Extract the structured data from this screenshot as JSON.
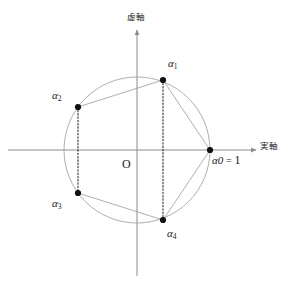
{
  "figure": {
    "width": 289,
    "height": 287,
    "background": "#ffffff",
    "axes": {
      "origin": {
        "x": 137,
        "y": 150
      },
      "origin_label": "O",
      "real_axis": {
        "label": "実軸",
        "label_x": 260,
        "label_y": 142,
        "x_start": 8,
        "x_end": 256,
        "y": 150,
        "arrow": "right",
        "color": "#8c8c8c"
      },
      "imaginary_axis": {
        "label": "虚軸",
        "label_x": 127,
        "label_y": 13,
        "x": 137,
        "y_start": 30,
        "y_end": 276,
        "arrow": "up",
        "color": "#8c8c8c"
      }
    },
    "circle": {
      "center_x": 137,
      "center_y": 150,
      "radius": 73,
      "stroke": "#9a9a9a",
      "stroke_width": 0.8,
      "fill": "none"
    },
    "styles": {
      "point_color": "#111111",
      "point_radius": 3.1,
      "chord_color": "#9a9a9a",
      "chord_width": 0.8,
      "dotted_color": "#2b2b2b",
      "dotted_width": 1.1,
      "dotted_dash": "1.4 1.9"
    }
  },
  "chart_data": {
    "type": "scatter",
    "xlabel": "実軸",
    "ylabel": "虚軸",
    "xlim": [
      -1.9,
      1.65
    ],
    "ylim": [
      -1.72,
      1.67
    ],
    "grid": false,
    "legend": null,
    "unit_circle": {
      "center": [
        0,
        0
      ],
      "radius": 1
    },
    "points": [
      {
        "id": "a0",
        "label": "α",
        "sub": "0",
        "label_text": "α₀ = 1",
        "re": 1.0,
        "im": 0.0,
        "px": 210,
        "py": 150,
        "label_x": 212,
        "label_y": 154
      },
      {
        "id": "a1",
        "label": "α",
        "sub": "1",
        "label_text": "α₁",
        "re": 0.309,
        "im": 0.951,
        "px": 163,
        "py": 80,
        "label_x": 168,
        "label_y": 58
      },
      {
        "id": "a2",
        "label": "α",
        "sub": "2",
        "label_text": "α₂",
        "re": -0.809,
        "im": 0.588,
        "px": 78,
        "py": 107,
        "label_x": 52,
        "label_y": 90
      },
      {
        "id": "a3",
        "label": "α",
        "sub": "3",
        "label_text": "α₃",
        "re": -0.809,
        "im": -0.588,
        "px": 78,
        "py": 193,
        "label_x": 52,
        "label_y": 198
      },
      {
        "id": "a4",
        "label": "α",
        "sub": "4",
        "label_text": "α₄",
        "re": 0.309,
        "im": -0.951,
        "px": 163,
        "py": 220,
        "label_x": 167,
        "label_y": 228
      }
    ],
    "chords": [
      {
        "from": "a0",
        "to": "a1",
        "style": "solid"
      },
      {
        "from": "a1",
        "to": "a2",
        "style": "solid"
      },
      {
        "from": "a2",
        "to": "a3",
        "style": "dotted"
      },
      {
        "from": "a3",
        "to": "a4",
        "style": "solid"
      },
      {
        "from": "a4",
        "to": "a0",
        "style": "solid"
      },
      {
        "from": "a1",
        "to": "a4",
        "style": "dotted"
      }
    ],
    "annotations": [
      {
        "text": "O",
        "re": -0.12,
        "im": -0.17
      },
      {
        "text": "α₀ = 1",
        "re": 1.05,
        "im": -0.1
      }
    ]
  },
  "labels": {
    "origin": "O",
    "real_axis": "実軸",
    "imaginary_axis": "虚軸",
    "alpha": "α",
    "sub0": "0",
    "sub1": "1",
    "sub2": "2",
    "sub3": "3",
    "sub4": "4",
    "equals": "=",
    "one": "1"
  }
}
